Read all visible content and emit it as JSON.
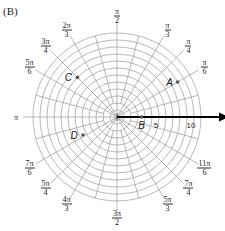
{
  "panel_label": "(B)",
  "grid": {
    "center": [
      117,
      117
    ],
    "ring_count": 12,
    "ring_spacing_px": 7,
    "spoke_step_deg": 15,
    "grid_color": "#9a9a9a",
    "axis_color": "#000000"
  },
  "polar_axis": {
    "zero_label": "0",
    "radius_labels": [
      {
        "text": "5",
        "r": 5
      },
      {
        "text": "10",
        "r": 10
      }
    ]
  },
  "angle_labels": [
    {
      "num": "π",
      "den": "6",
      "deg": 30
    },
    {
      "num": "π",
      "den": "4",
      "deg": 45
    },
    {
      "num": "π",
      "den": "3",
      "deg": 60
    },
    {
      "num": "π",
      "den": "2",
      "deg": 90
    },
    {
      "num": "2π",
      "den": "3",
      "deg": 120
    },
    {
      "num": "3π",
      "den": "4",
      "deg": 135
    },
    {
      "num": "5π",
      "den": "6",
      "deg": 150
    },
    {
      "plain": "π",
      "deg": 180
    },
    {
      "num": "7π",
      "den": "6",
      "deg": 210
    },
    {
      "num": "5π",
      "den": "4",
      "deg": 225
    },
    {
      "num": "4π",
      "den": "3",
      "deg": 240
    },
    {
      "num": "3π",
      "den": "2",
      "deg": 270
    },
    {
      "num": "5π",
      "den": "3",
      "deg": 300
    },
    {
      "num": "7π",
      "den": "4",
      "deg": 315
    },
    {
      "num": "11π",
      "den": "6",
      "deg": 330
    }
  ],
  "points": [
    {
      "label": "A",
      "r": 10,
      "theta": "π/6",
      "deg": 30
    },
    {
      "label": "B",
      "r": 3.5,
      "theta": "0",
      "deg": 0
    },
    {
      "label": "C",
      "r": 8,
      "theta": "3π/4",
      "deg": 135
    },
    {
      "label": "D",
      "r": 5.5,
      "theta": "7π/6",
      "deg": 208
    }
  ]
}
